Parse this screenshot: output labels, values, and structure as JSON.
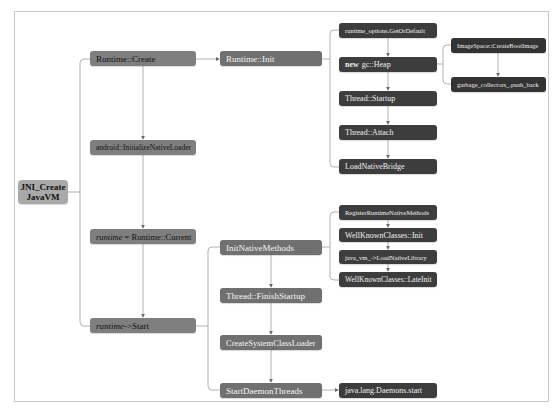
{
  "diagram": {
    "colors": {
      "root": "#a9a9a9",
      "level1": "#7f7f7f",
      "level2": "#707070",
      "level3": "#3d3d3d",
      "level4": "#333333",
      "connector": "#9a9a9a",
      "frame_border": "#c8c8c8"
    },
    "root": {
      "line1": "JNI_Create",
      "line2": "JavaVM"
    },
    "level1": {
      "runtime_create": "Runtime::Create",
      "init_native_loader": "android::InitializeNativeLoader",
      "runtime_current": {
        "var": "runtime",
        "rest": "= Runtime::Current"
      },
      "runtime_start": {
        "var": "runtime",
        "rest": "->Start"
      }
    },
    "level2": {
      "runtime_init": "Runtime::Init",
      "init_native_methods": "InitNativeMethods",
      "finish_startup": "Thread::FinishStartup",
      "create_system_class_loader": "CreateSystemClassLoader",
      "start_daemon_threads": "StartDaemonThreads"
    },
    "level3": {
      "get_or_default": "runtime_options.GetOrDefault",
      "new_heap": {
        "keyword": "new",
        "rest": "gc::Heap"
      },
      "thread_startup": "Thread::Startup",
      "thread_attach": "Thread::Attach",
      "load_native_bridge": "LoadNativeBridge",
      "register_runtime_native_methods": "RegisterRuntimeNativeMethods",
      "well_known_classes_init": "WellKnownClasses::Init",
      "load_native_library": "java_vm_->LoadNativeLibrary",
      "well_known_classes_late_init": "WellKnownClasses::LateInit",
      "daemons_start": "java.lang.Daemons.start"
    },
    "level4": {
      "create_boot_image": "ImageSpace::CreateBootImage",
      "push_back": "garbage_collectors_.push_back"
    }
  }
}
